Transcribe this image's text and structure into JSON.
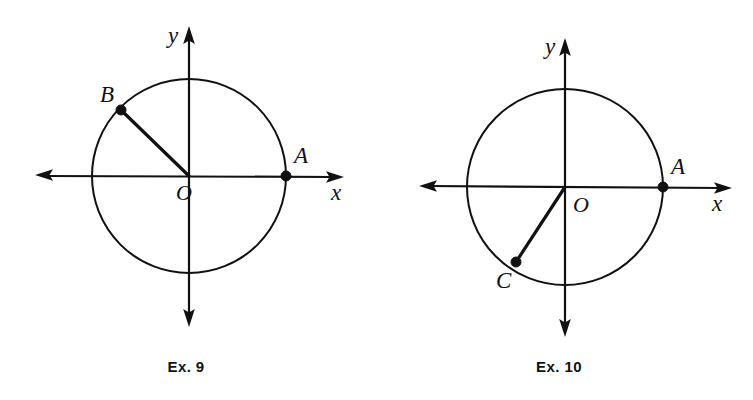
{
  "page": {
    "background_color": "#ffffff",
    "ink_color": "#111111",
    "width": 753,
    "height": 400
  },
  "figures": [
    {
      "id": "ex9",
      "caption": "Ex. 9",
      "caption_position": {
        "x": 186,
        "y": 372
      },
      "origin": {
        "x": 189,
        "y": 176
      },
      "radius": 97,
      "axes": {
        "x_axis": {
          "label": "x",
          "label_position": {
            "x": 331,
            "y": 200
          },
          "left_end": {
            "x": 36,
            "y": 176
          },
          "right_end": {
            "x": 342,
            "y": 176
          },
          "arrow_left": true,
          "arrow_right": true
        },
        "y_axis": {
          "label": "y",
          "label_position": {
            "x": 168,
            "y": 43
          },
          "top_end": {
            "x": 189,
            "y": 28
          },
          "bottom_end": {
            "x": 189,
            "y": 325
          },
          "arrow_top": true,
          "arrow_bottom": true
        }
      },
      "points": [
        {
          "label": "A",
          "x": 286,
          "y": 176,
          "angle_deg": 0,
          "label_position": {
            "x": 294,
            "y": 163
          },
          "has_radius_line": false
        },
        {
          "label": "B",
          "x": 121,
          "y": 110,
          "angle_deg": 136,
          "label_position": {
            "x": 100,
            "y": 102
          },
          "has_radius_line": true
        }
      ],
      "origin_label": "O",
      "origin_label_position": {
        "x": 176,
        "y": 200
      }
    },
    {
      "id": "ex10",
      "caption": "Ex. 10",
      "caption_position": {
        "x": 559,
        "y": 372
      },
      "origin": {
        "x": 565,
        "y": 187
      },
      "radius": 98,
      "axes": {
        "x_axis": {
          "label": "x",
          "label_position": {
            "x": 712,
            "y": 211
          },
          "left_end": {
            "x": 420,
            "y": 187
          },
          "right_end": {
            "x": 730,
            "y": 187
          },
          "arrow_left": true,
          "arrow_right": true
        },
        "y_axis": {
          "label": "y",
          "label_position": {
            "x": 545,
            "y": 54
          },
          "top_end": {
            "x": 565,
            "y": 40
          },
          "bottom_end": {
            "x": 565,
            "y": 335
          },
          "arrow_top": true,
          "arrow_bottom": true
        }
      },
      "points": [
        {
          "label": "A",
          "x": 663,
          "y": 187,
          "angle_deg": 0,
          "label_position": {
            "x": 671,
            "y": 174
          },
          "has_radius_line": false
        },
        {
          "label": "C",
          "x": 516,
          "y": 262,
          "angle_deg": 237,
          "label_position": {
            "x": 496,
            "y": 288
          },
          "has_radius_line": true
        }
      ],
      "origin_label": "O",
      "origin_label_position": {
        "x": 573,
        "y": 212
      }
    }
  ]
}
